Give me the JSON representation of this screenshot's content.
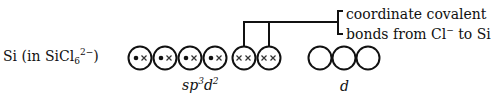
{
  "species_label": {
    "prefix": "Si (in SiCl",
    "sub": "6",
    "sup": "2−",
    "suffix": ")"
  },
  "annotation": {
    "line1": "coordinate covalent",
    "line2_a": "bonds from Cl",
    "line2_sup": "−",
    "line2_b": " to Si"
  },
  "hybrid_label": {
    "a": "sp",
    "sup1": "3",
    "b": "d",
    "sup2": "2"
  },
  "d_label": "d",
  "orbitals": {
    "hybrid": [
      {
        "content": "•×"
      },
      {
        "content": "•×"
      },
      {
        "content": "•×"
      },
      {
        "content": "•×"
      },
      {
        "content": "××"
      },
      {
        "content": "××"
      }
    ],
    "d": [
      {
        "content": ""
      },
      {
        "content": ""
      },
      {
        "content": ""
      }
    ]
  },
  "colors": {
    "ink": "#111111",
    "background": "#ffffff"
  }
}
